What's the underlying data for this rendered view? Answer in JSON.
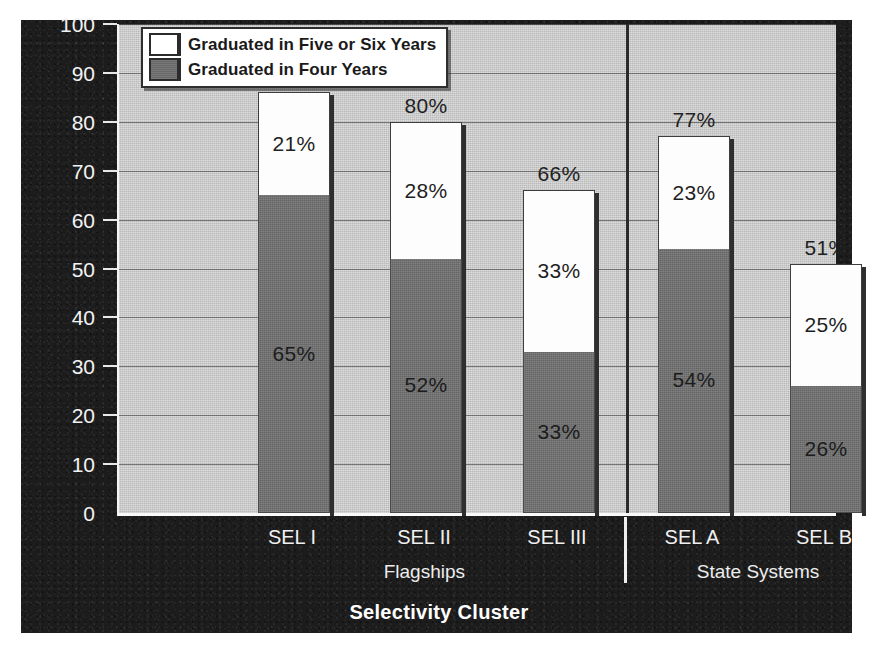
{
  "chart_data": {
    "type": "bar",
    "subtype": "stacked-bar",
    "title": "",
    "xlabel": "Selectivity Cluster",
    "ylabel": "Graduation Rate (Percent)",
    "ylim": [
      0,
      100
    ],
    "ytick_step": 10,
    "yticks": [
      "100",
      "90",
      "80",
      "70",
      "60",
      "50",
      "40",
      "30",
      "20",
      "10",
      "0"
    ],
    "grid": "horizontal",
    "legend_position": "top-left-inside",
    "categories": [
      "SEL I",
      "SEL II",
      "SEL III",
      "SEL A",
      "SEL B"
    ],
    "series": [
      {
        "name": "Graduated in Four Years",
        "color": "#6e6e6e",
        "values": [
          65,
          52,
          33,
          54,
          26
        ],
        "labels": [
          "65%",
          "52%",
          "33%",
          "54%",
          "26%"
        ]
      },
      {
        "name": "Graduated in Five or Six Years",
        "color": "#ffffff",
        "values": [
          21,
          28,
          33,
          23,
          25
        ],
        "labels": [
          "21%",
          "28%",
          "33%",
          "23%",
          "25%"
        ]
      }
    ],
    "totals": [
      86,
      80,
      66,
      77,
      51
    ],
    "total_labels": [
      "86%",
      "80%",
      "66%",
      "77%",
      "51%"
    ],
    "groups": [
      {
        "label": "Flagships",
        "categories": [
          "SEL I",
          "SEL II",
          "SEL III"
        ]
      },
      {
        "label": "State Systems",
        "categories": [
          "SEL A",
          "SEL B"
        ]
      }
    ],
    "divider": true
  },
  "legend": {
    "items": [
      {
        "label": "Graduated in Five or Six Years",
        "swatch": "white"
      },
      {
        "label": "Graduated in Four Years",
        "swatch": "gray"
      }
    ]
  },
  "colors": {
    "panel_background": "#1c1c1c",
    "plot_background": "#b9b9b9",
    "bar_four_years": "#6e6e6e",
    "bar_five_six_years": "#ffffff",
    "gridline": "#565656",
    "axis_text": "#f0f0f0",
    "value_text": "#1f1f1f"
  }
}
